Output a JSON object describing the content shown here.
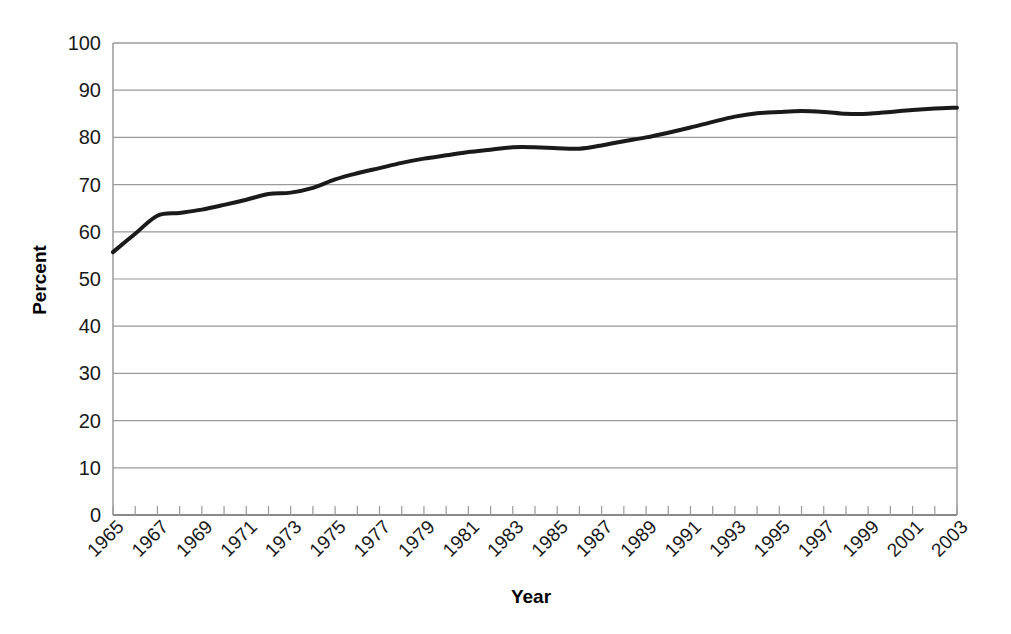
{
  "chart_data": {
    "type": "line",
    "title": "",
    "subtitle": "",
    "xlabel": "Year",
    "ylabel": "Percent",
    "xlim": [
      1965,
      2003
    ],
    "ylim": [
      0,
      100
    ],
    "grid": true,
    "grid_axis": "y",
    "legend": "none",
    "line_color": "#1a1a1a",
    "line_width": 4,
    "x_tick_labels": [
      "1965",
      "1967",
      "1969",
      "1971",
      "1973",
      "1975",
      "1977",
      "1979",
      "1981",
      "1983",
      "1985",
      "1987",
      "1989",
      "1991",
      "1993",
      "1995",
      "1997",
      "1999",
      "2001",
      "2003"
    ],
    "x_tick_values": [
      1965,
      1967,
      1969,
      1971,
      1973,
      1975,
      1977,
      1979,
      1981,
      1983,
      1985,
      1987,
      1989,
      1991,
      1993,
      1995,
      1997,
      1999,
      2001,
      2003
    ],
    "y_tick_labels": [
      "0",
      "10",
      "20",
      "30",
      "40",
      "50",
      "60",
      "70",
      "80",
      "90",
      "100"
    ],
    "y_tick_values": [
      0,
      10,
      20,
      30,
      40,
      50,
      60,
      70,
      80,
      90,
      100
    ],
    "x": [
      1965,
      1966,
      1967,
      1968,
      1969,
      1970,
      1971,
      1972,
      1973,
      1974,
      1975,
      1976,
      1977,
      1978,
      1979,
      1980,
      1981,
      1982,
      1983,
      1984,
      1985,
      1986,
      1987,
      1988,
      1989,
      1990,
      1991,
      1992,
      1993,
      1994,
      1995,
      1996,
      1997,
      1998,
      1999,
      2000,
      2001,
      2002,
      2003
    ],
    "values": [
      55.7,
      59.6,
      63.4,
      64.0,
      64.7,
      65.7,
      66.8,
      68.0,
      68.3,
      69.3,
      71.1,
      72.4,
      73.5,
      74.6,
      75.5,
      76.2,
      76.9,
      77.4,
      77.9,
      77.9,
      77.7,
      77.6,
      78.3,
      79.2,
      80.0,
      81.0,
      82.1,
      83.3,
      84.4,
      85.1,
      85.4,
      85.6,
      85.4,
      85.0,
      85.0,
      85.4,
      85.8,
      86.1,
      86.3
    ]
  },
  "axis": {
    "y_title": "Percent",
    "x_title": "Year"
  }
}
